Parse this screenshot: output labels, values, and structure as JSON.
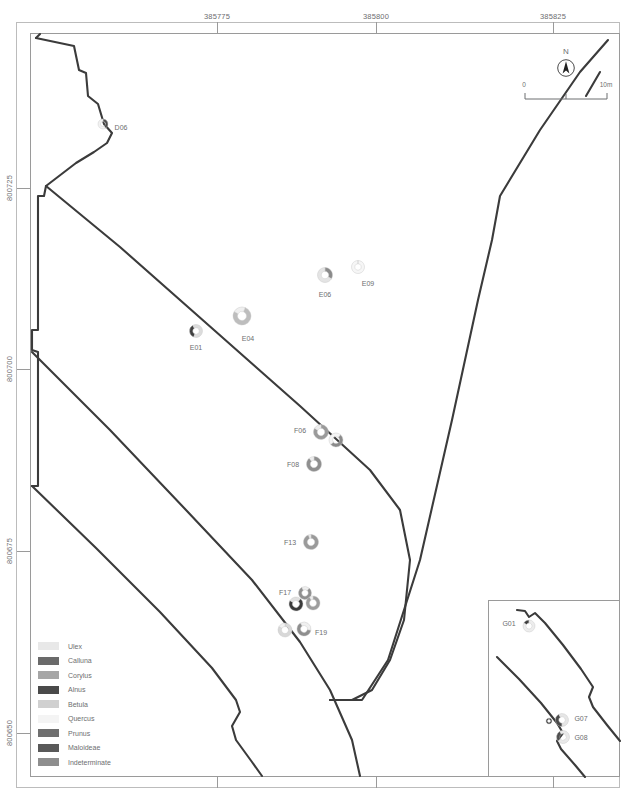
{
  "figure": {
    "background_color": "#ffffff",
    "line_color": "#3b3b3b",
    "frame_color": "#9a9a9a",
    "text_color": "#6d6e70"
  },
  "grid": {
    "x_axis": {
      "label_position": "top",
      "ticks": [
        {
          "label": "385775",
          "x": 217
        },
        {
          "label": "385800",
          "x": 376
        },
        {
          "label": "385825",
          "x": 553
        }
      ],
      "bottom_ticks_unlabeled": [
        217,
        376,
        553
      ]
    },
    "y_axis": {
      "label_position": "left",
      "ticks": [
        {
          "label": "800725",
          "y": 188
        },
        {
          "label": "800700",
          "y": 369
        },
        {
          "label": "800675",
          "y": 551
        },
        {
          "label": "800650",
          "y": 733
        }
      ]
    }
  },
  "north_arrow": {
    "letter": "N",
    "icon": "north-arrow-icon"
  },
  "scale_bar": {
    "min_label": "0",
    "max_label": "10m",
    "divisions": 2
  },
  "legend": {
    "items": [
      {
        "label": "Ulex",
        "color": "#e8e8e8"
      },
      {
        "label": "Calluna",
        "color": "#6a6a6a"
      },
      {
        "label": "Corylus",
        "color": "#a6a6a6"
      },
      {
        "label": "Alnus",
        "color": "#4a4a4a"
      },
      {
        "label": "Betula",
        "color": "#d0d0d0"
      },
      {
        "label": "Quercus",
        "color": "#f4f4f4"
      },
      {
        "label": "Prunus",
        "color": "#6f6f6f"
      },
      {
        "label": "Maloideae",
        "color": "#595959"
      },
      {
        "label": "Indeterminate",
        "color": "#8e8e8e"
      }
    ]
  },
  "samples": [
    {
      "id": "D06",
      "x": 103,
      "y": 124,
      "r": 5.0,
      "label_dx": 18,
      "label_dy": 3,
      "segments": [
        {
          "color": "#4a4a4a",
          "from": 0,
          "to": 150
        },
        {
          "color": "#f2f2f2",
          "from": 150,
          "to": 360
        }
      ]
    },
    {
      "id": "E01",
      "x": 196,
      "y": 331,
      "r": 6.5,
      "label_dx": 0,
      "label_dy": 16,
      "segments": [
        {
          "color": "#3f3f3f",
          "from": 200,
          "to": 330
        },
        {
          "color": "#dcdcdc",
          "from": 330,
          "to": 560
        }
      ]
    },
    {
      "id": "E04",
      "x": 242,
      "y": 316,
      "r": 9.0,
      "label_dx": 6,
      "label_dy": 22,
      "segments": [
        {
          "color": "#bdbdbd",
          "from": 20,
          "to": 300
        },
        {
          "color": "#efefef",
          "from": 300,
          "to": 380
        }
      ]
    },
    {
      "id": "E06",
      "x": 325,
      "y": 275,
      "r": 7.5,
      "label_dx": 0,
      "label_dy": 19,
      "segments": [
        {
          "color": "#8a8a8a",
          "from": 0,
          "to": 120
        },
        {
          "color": "#e4e4e4",
          "from": 120,
          "to": 360
        }
      ]
    },
    {
      "id": "E09",
      "x": 358,
      "y": 267,
      "r": 6.5,
      "label_dx": 10,
      "label_dy": 16,
      "segments": [
        {
          "color": "#f6f6f6",
          "from": 0,
          "to": 360
        }
      ]
    },
    {
      "id": "F06",
      "x": 321,
      "y": 432,
      "r": 7.5,
      "label_dx": -21,
      "label_dy": -2,
      "segments": [
        {
          "color": "#9a9a9a",
          "from": 0,
          "to": 300
        },
        {
          "color": "#ededed",
          "from": 300,
          "to": 360
        }
      ]
    },
    {
      "id": "F08",
      "x": 314,
      "y": 464,
      "r": 7.5,
      "label_dx": -21,
      "label_dy": 0,
      "segments": [
        {
          "color": "#8f8f8f",
          "from": 0,
          "to": 320
        },
        {
          "color": "#ededed",
          "from": 320,
          "to": 360
        }
      ]
    },
    {
      "id": "F13",
      "x": 311,
      "y": 542,
      "r": 7.5,
      "label_dx": -21,
      "label_dy": 0,
      "segments": [
        {
          "color": "#9a9a9a",
          "from": 0,
          "to": 340
        },
        {
          "color": "#ececec",
          "from": 340,
          "to": 360
        }
      ]
    },
    {
      "id": "F17",
      "x": 305,
      "y": 593,
      "r": 6.5,
      "label_dx": -20,
      "label_dy": -1,
      "segments": [
        {
          "color": "#8f8f8f",
          "from": 40,
          "to": 330
        },
        {
          "color": "#eeeeee",
          "from": 330,
          "to": 400
        }
      ]
    },
    {
      "id": "F19",
      "x": 285,
      "y": 630,
      "r": 7.0,
      "label_dx": 36,
      "label_dy": 2,
      "segments": [
        {
          "color": "#d8d8d8",
          "from": 0,
          "to": 300
        },
        {
          "color": "#f2f2f2",
          "from": 300,
          "to": 360
        }
      ]
    }
  ],
  "samples_extra": [
    {
      "id": "",
      "x": 336,
      "y": 440,
      "r": 7.0,
      "segments": [
        {
          "color": "#8b8b8b",
          "from": 40,
          "to": 230
        },
        {
          "color": "#f4f4f4",
          "from": 230,
          "to": 400
        }
      ]
    },
    {
      "id": "",
      "x": 296,
      "y": 604,
      "r": 7.0,
      "segments": [
        {
          "color": "#3a3a3a",
          "from": 40,
          "to": 300
        },
        {
          "color": "#e0e0e0",
          "from": 300,
          "to": 400
        }
      ]
    },
    {
      "id": "",
      "x": 313,
      "y": 603,
      "r": 7.0,
      "segments": [
        {
          "color": "#9d9d9d",
          "from": 0,
          "to": 330
        },
        {
          "color": "#efefef",
          "from": 330,
          "to": 360
        }
      ]
    },
    {
      "id": "",
      "x": 304,
      "y": 629,
      "r": 7.0,
      "segments": [
        {
          "color": "#8e8e8e",
          "from": 100,
          "to": 330
        },
        {
          "color": "#f0f0f0",
          "from": 330,
          "to": 460
        }
      ]
    }
  ],
  "inset": {
    "samples": [
      {
        "id": "G01",
        "x": 528,
        "y": 625,
        "r": 6.0,
        "label_dx": -20,
        "label_dy": -3,
        "segments": [
          {
            "color": "#3d3d3d",
            "from": 300,
            "to": 360
          },
          {
            "color": "#ededed",
            "from": 0,
            "to": 300
          }
        ]
      },
      {
        "id": "G07",
        "x": 561,
        "y": 719,
        "r": 6.5,
        "label_dx": 19,
        "label_dy": -2,
        "segments": [
          {
            "color": "#4a4a4a",
            "from": 180,
            "to": 330
          },
          {
            "color": "#e6e6e6",
            "from": 330,
            "to": 540
          }
        ]
      },
      {
        "id": "G08",
        "x": 562,
        "y": 736,
        "r": 6.5,
        "label_dx": 18,
        "label_dy": 0,
        "segments": [
          {
            "color": "#4f4f4f",
            "from": 230,
            "to": 330
          },
          {
            "color": "#e9e9e9",
            "from": 330,
            "to": 590
          }
        ]
      },
      {
        "id": "",
        "x": 548,
        "y": 716,
        "r": 3.0,
        "segments": [
          {
            "color": "#4a4a4a",
            "from": 0,
            "to": 360
          }
        ]
      }
    ]
  }
}
